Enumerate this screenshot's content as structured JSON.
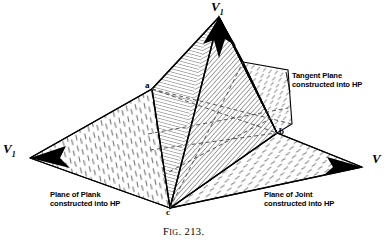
{
  "figure": {
    "caption_prefix": "F",
    "caption_smallcaps": "IG",
    "caption_number": ". 213."
  },
  "vertices": {
    "apex": {
      "name": "apex-vertex",
      "letter": "V",
      "subscript": "1"
    },
    "left": {
      "name": "left-vertex",
      "letter": "V",
      "subscript": "1"
    },
    "right": {
      "name": "right-vertex",
      "letter": "V",
      "subscript": ""
    }
  },
  "points": {
    "a": "a",
    "b": "b",
    "c": "c"
  },
  "annotations": {
    "tangent_plane": {
      "line1": "Tangent Plane",
      "line2": "constructed into HP"
    },
    "plane_of_plank": {
      "line1": "Plane of Plank",
      "line2": "constructed into HP"
    },
    "plane_of_joint": {
      "line1": "Plane of Joint",
      "line2": "constructed into HP"
    }
  },
  "colors": {
    "ink": "#000000",
    "paper": "#ffffff",
    "hatch_light": "#8a8a8a",
    "hatch_dark": "#3a3a3a",
    "dashed": "#5a5a5a"
  },
  "geometry": {
    "apex": [
      219,
      17
    ],
    "left_vertex": [
      30,
      158
    ],
    "right_vertex": [
      362,
      167
    ],
    "a": [
      152,
      89
    ],
    "b": [
      277,
      133
    ],
    "c": [
      170,
      208
    ],
    "tangent_top_right": [
      288,
      70
    ],
    "tangent_right": [
      292,
      124
    ]
  }
}
